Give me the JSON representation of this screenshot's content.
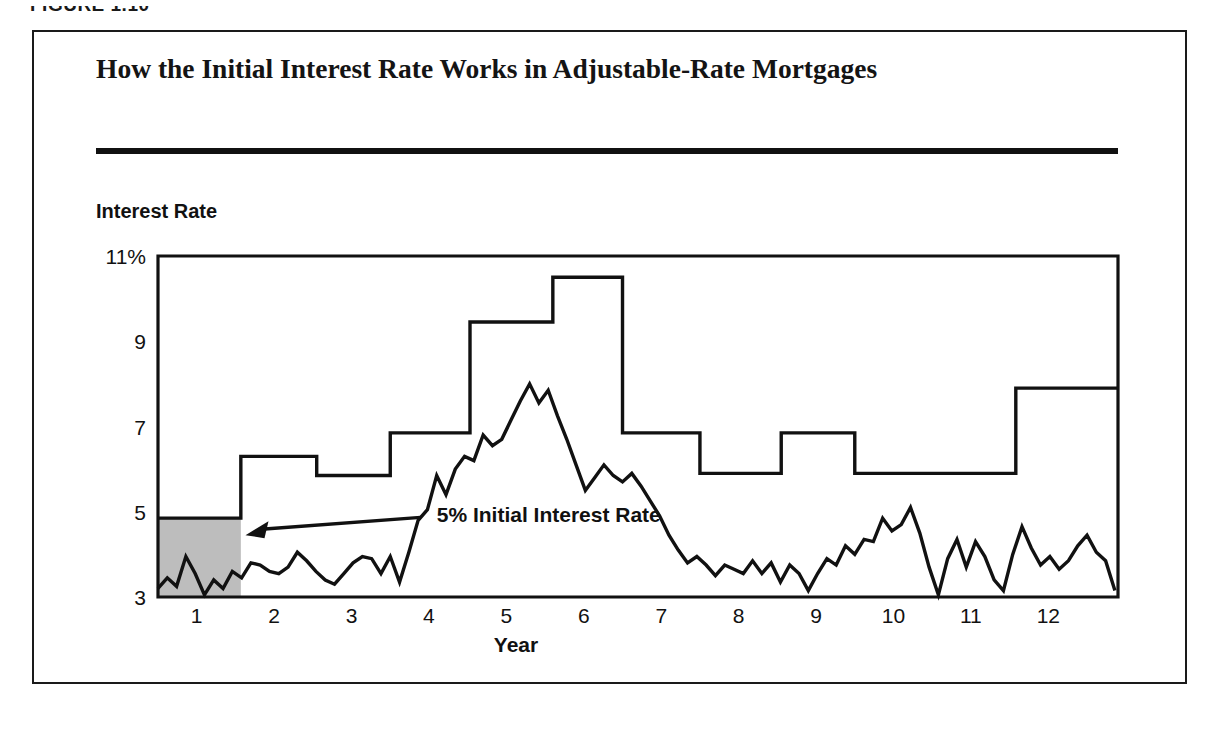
{
  "figure": {
    "caption": "FIGURE 1.10",
    "title": "How the Initial Interest Rate Works in Adjustable-Rate Mortgages"
  },
  "chart_data": {
    "type": "line",
    "title": "How the Initial Interest Rate Works in Adjustable-Rate Mortgages",
    "xlabel": "Year",
    "ylabel": "Interest Rate",
    "xlim": [
      0.5,
      12.9
    ],
    "ylim": [
      3,
      11
    ],
    "grid": false,
    "legend": null,
    "y_ticks": [
      3,
      5,
      7,
      9,
      11
    ],
    "y_tick_labels": [
      "3",
      "5",
      "7",
      "9",
      "11%"
    ],
    "x_ticks": [
      1,
      2,
      3,
      4,
      5,
      6,
      7,
      8,
      9,
      10,
      11,
      12
    ],
    "x_tick_labels": [
      "1",
      "2",
      "3",
      "4",
      "5",
      "6",
      "7",
      "8",
      "9",
      "10",
      "11",
      "12"
    ],
    "annotations": [
      {
        "text": "5% Initial Interest Rate",
        "x": 4.1,
        "y": 4.75,
        "arrow_to_x": 1.63,
        "arrow_to_y": 4.45
      }
    ],
    "shaded_region": {
      "label": "5% initial interest rate period",
      "x_start": 0.5,
      "x_end": 1.57,
      "y_start": 3,
      "y_end": 4.85,
      "color": "#bdbdbd"
    },
    "series": [
      {
        "name": "Mortgage interest rate (step)",
        "type": "step",
        "style": "post",
        "color": "#111111",
        "x": [
          0.5,
          1.57,
          2.55,
          3.5,
          4.53,
          5.6,
          6.5,
          7.5,
          8.55,
          9.5,
          10.5,
          11.58,
          12.9
        ],
        "values": [
          4.85,
          6.3,
          5.85,
          6.85,
          9.45,
          10.5,
          6.85,
          5.9,
          6.85,
          5.9,
          5.9,
          7.9,
          7.9
        ]
      },
      {
        "name": "Index rate",
        "type": "line",
        "color": "#111111",
        "x": [
          0.5,
          0.62,
          0.74,
          0.86,
          0.98,
          1.1,
          1.22,
          1.34,
          1.46,
          1.58,
          1.7,
          1.82,
          1.94,
          2.06,
          2.18,
          2.3,
          2.42,
          2.54,
          2.66,
          2.78,
          2.9,
          3.02,
          3.14,
          3.26,
          3.38,
          3.5,
          3.62,
          3.74,
          3.86,
          3.98,
          4.1,
          4.22,
          4.34,
          4.46,
          4.58,
          4.7,
          4.82,
          4.94,
          5.06,
          5.18,
          5.3,
          5.42,
          5.54,
          5.66,
          5.78,
          5.9,
          6.02,
          6.14,
          6.26,
          6.38,
          6.5,
          6.62,
          6.74,
          6.86,
          6.98,
          7.1,
          7.22,
          7.34,
          7.46,
          7.58,
          7.7,
          7.82,
          7.94,
          8.06,
          8.18,
          8.3,
          8.42,
          8.54,
          8.66,
          8.78,
          8.9,
          9.02,
          9.14,
          9.26,
          9.38,
          9.5,
          9.62,
          9.74,
          9.86,
          9.98,
          10.1,
          10.22,
          10.34,
          10.46,
          10.58,
          10.7,
          10.82,
          10.94,
          11.06,
          11.18,
          11.3,
          11.42,
          11.54,
          11.66,
          11.78,
          11.9,
          12.02,
          12.14,
          12.26,
          12.38,
          12.5,
          12.62,
          12.74,
          12.86
        ],
        "values": [
          3.2,
          3.45,
          3.25,
          3.95,
          3.55,
          3.05,
          3.4,
          3.2,
          3.6,
          3.45,
          3.8,
          3.75,
          3.6,
          3.55,
          3.7,
          4.05,
          3.85,
          3.6,
          3.4,
          3.3,
          3.55,
          3.8,
          3.95,
          3.9,
          3.55,
          3.95,
          3.35,
          4.05,
          4.8,
          5.05,
          5.85,
          5.4,
          6.0,
          6.3,
          6.2,
          6.8,
          6.55,
          6.7,
          7.15,
          7.6,
          8.0,
          7.55,
          7.85,
          7.25,
          6.7,
          6.1,
          5.5,
          5.8,
          6.1,
          5.85,
          5.7,
          5.9,
          5.6,
          5.25,
          4.9,
          4.45,
          4.1,
          3.8,
          3.95,
          3.75,
          3.5,
          3.75,
          3.65,
          3.55,
          3.85,
          3.55,
          3.8,
          3.35,
          3.75,
          3.55,
          3.15,
          3.55,
          3.9,
          3.75,
          4.2,
          4.0,
          4.35,
          4.3,
          4.85,
          4.55,
          4.7,
          5.1,
          4.5,
          3.7,
          3.05,
          3.9,
          4.35,
          3.7,
          4.3,
          3.95,
          3.4,
          3.15,
          4.0,
          4.65,
          4.15,
          3.75,
          3.95,
          3.65,
          3.85,
          4.2,
          4.45,
          4.05,
          3.85,
          3.15
        ]
      }
    ]
  }
}
